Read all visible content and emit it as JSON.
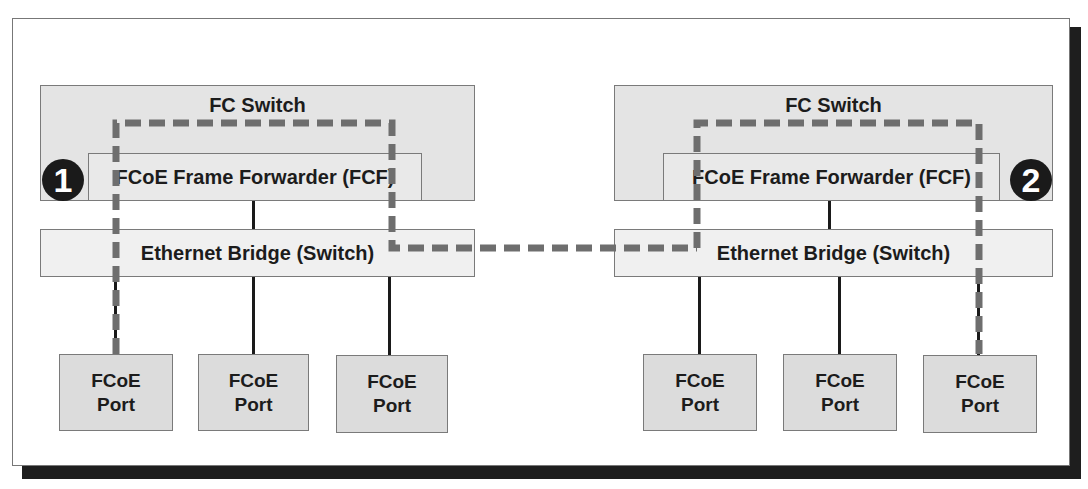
{
  "diagram": {
    "left_site": {
      "fc_switch_label": "FC Switch",
      "fcf_label": "FCoE Frame Forwarder (FCF)",
      "bridge_label": "Ethernet Bridge (Switch)",
      "badge": "1",
      "ports": [
        {
          "line1": "FCoE",
          "line2": "Port"
        },
        {
          "line1": "FCoE",
          "line2": "Port"
        },
        {
          "line1": "FCoE",
          "line2": "Port"
        }
      ]
    },
    "right_site": {
      "fc_switch_label": "FC Switch",
      "fcf_label": "FCoE Frame Forwarder (FCF)",
      "bridge_label": "Ethernet Bridge (Switch)",
      "badge": "2",
      "ports": [
        {
          "line1": "FCoE",
          "line2": "Port"
        },
        {
          "line1": "FCoE",
          "line2": "Port"
        },
        {
          "line1": "FCoE",
          "line2": "Port"
        }
      ]
    },
    "path_color": "#6e6e6e",
    "link_color": "#1a1a1a",
    "box_fill": "#e4e4e4"
  }
}
